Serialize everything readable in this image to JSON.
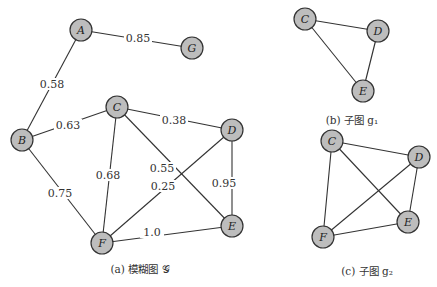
{
  "figure": {
    "main_graph": {
      "caption": "(a) 模糊图 𝒢",
      "nodes": [
        {
          "id": "A",
          "label": "A",
          "x": 81,
          "y": 30
        },
        {
          "id": "G",
          "label": "G",
          "x": 192,
          "y": 48
        },
        {
          "id": "B",
          "label": "B",
          "x": 22,
          "y": 140
        },
        {
          "id": "C",
          "label": "C",
          "x": 117,
          "y": 107
        },
        {
          "id": "D",
          "label": "D",
          "x": 232,
          "y": 130
        },
        {
          "id": "E",
          "label": "E",
          "x": 232,
          "y": 226
        },
        {
          "id": "F",
          "label": "F",
          "x": 102,
          "y": 243
        }
      ],
      "edges": [
        {
          "from": "A",
          "to": "G",
          "weight": "0.85",
          "lx": 138,
          "ly": 38
        },
        {
          "from": "A",
          "to": "B",
          "weight": "0.58",
          "lx": 52,
          "ly": 84
        },
        {
          "from": "B",
          "to": "C",
          "weight": "0.63",
          "lx": 68,
          "ly": 125
        },
        {
          "from": "C",
          "to": "D",
          "weight": "0.38",
          "lx": 174,
          "ly": 120
        },
        {
          "from": "B",
          "to": "F",
          "weight": "0.75",
          "lx": 60,
          "ly": 193
        },
        {
          "from": "C",
          "to": "F",
          "weight": "0.68",
          "lx": 108,
          "ly": 175
        },
        {
          "from": "C",
          "to": "E",
          "weight": "0.55",
          "lx": 162,
          "ly": 168
        },
        {
          "from": "D",
          "to": "F",
          "weight": "0.25",
          "lx": 163,
          "ly": 186
        },
        {
          "from": "D",
          "to": "E",
          "weight": "0.95",
          "lx": 224,
          "ly": 183
        },
        {
          "from": "F",
          "to": "E",
          "weight": "1.0",
          "lx": 152,
          "ly": 232
        }
      ]
    },
    "subgraph_g1": {
      "caption": "(b) 子图 g₁",
      "nodes": [
        {
          "id": "C",
          "label": "C",
          "x": 305,
          "y": 19
        },
        {
          "id": "D",
          "label": "D",
          "x": 378,
          "y": 31
        },
        {
          "id": "E",
          "label": "E",
          "x": 363,
          "y": 91
        }
      ],
      "edges": [
        {
          "from": "C",
          "to": "D"
        },
        {
          "from": "D",
          "to": "E"
        },
        {
          "from": "C",
          "to": "E"
        }
      ]
    },
    "subgraph_g2": {
      "caption": "(c) 子图 g₂",
      "nodes": [
        {
          "id": "C",
          "label": "C",
          "x": 332,
          "y": 141
        },
        {
          "id": "D",
          "label": "D",
          "x": 419,
          "y": 157
        },
        {
          "id": "E",
          "label": "E",
          "x": 408,
          "y": 222
        },
        {
          "id": "F",
          "label": "F",
          "x": 323,
          "y": 237
        }
      ],
      "edges": [
        {
          "from": "C",
          "to": "D"
        },
        {
          "from": "C",
          "to": "E"
        },
        {
          "from": "C",
          "to": "F"
        },
        {
          "from": "D",
          "to": "E"
        },
        {
          "from": "D",
          "to": "F"
        },
        {
          "from": "F",
          "to": "E"
        }
      ]
    },
    "colors": {
      "node_fill": "#bdbdbd",
      "node_stroke": "#333333",
      "edge": "#333333"
    }
  }
}
